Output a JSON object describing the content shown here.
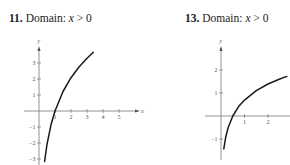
{
  "chart_data": [
    {
      "type": "line",
      "problem_number": "11.",
      "title": "Domain: x > 0",
      "title_prefix": "Domain: ",
      "title_var": "x",
      "title_rest": " > 0",
      "xlabel": "x",
      "ylabel": "y",
      "x_ticks": [
        "1",
        "2",
        "3",
        "4",
        "5"
      ],
      "y_ticks": [
        "3",
        "2",
        "1",
        "-1",
        "-2",
        "-3"
      ],
      "xlim": [
        -0.5,
        5.6
      ],
      "ylim": [
        -3.3,
        4.2
      ],
      "grid": false,
      "series": [
        {
          "name": "curve",
          "x": [
            0.35,
            0.5,
            0.75,
            1,
            1.5,
            2,
            2.5,
            3,
            3.4
          ],
          "y": [
            -3.15,
            -2.08,
            -0.86,
            0,
            1.22,
            2.08,
            2.75,
            3.3,
            3.67
          ]
        }
      ]
    },
    {
      "type": "line",
      "problem_number": "13.",
      "title": "Domain: x > 0",
      "title_prefix": "Domain: ",
      "title_var": "x",
      "title_rest": " > 0",
      "xlabel": "",
      "ylabel": "y",
      "x_ticks": [
        "1",
        "2"
      ],
      "y_ticks": [
        "2",
        "1",
        "-1"
      ],
      "xlim": [
        -0.5,
        3
      ],
      "ylim": [
        -1.5,
        2.6
      ],
      "grid": false,
      "series": [
        {
          "name": "curve",
          "x": [
            0.12,
            0.2,
            0.3,
            0.5,
            0.75,
            1,
            1.5,
            2,
            2.5,
            2.8
          ],
          "y": [
            -1.43,
            -0.92,
            -0.51,
            0,
            0.41,
            0.69,
            1.1,
            1.39,
            1.61,
            1.72
          ]
        }
      ]
    }
  ]
}
